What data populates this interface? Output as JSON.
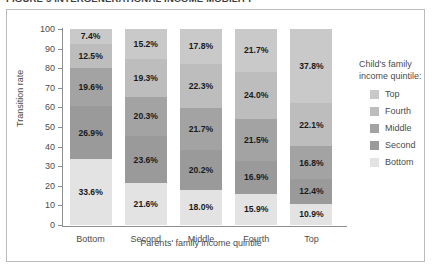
{
  "figure": {
    "title": "FIGURE 5  INTERGENERATIONAL INCOME MOBILITY"
  },
  "chart_data": {
    "type": "bar",
    "stacked": true,
    "title": "",
    "xlabel": "Parents' family income quintile",
    "ylabel": "Transition rate",
    "ylim": [
      0,
      100
    ],
    "yticks": [
      0,
      10,
      20,
      30,
      40,
      50,
      60,
      70,
      80,
      90,
      100
    ],
    "grid": false,
    "legend_position": "right",
    "legend_title": "Child's family income quintile:",
    "categories": [
      "Bottom",
      "Second",
      "Middle",
      "Fourth",
      "Top"
    ],
    "series": [
      {
        "name": "Top",
        "color": "#c9c9c9",
        "values": [
          7.4,
          15.2,
          17.8,
          21.7,
          37.8
        ],
        "labels": [
          "7.4%",
          "15.2%",
          "17.8%",
          "21.7%",
          "37.8%"
        ]
      },
      {
        "name": "Fourth",
        "color": "#bdbdbd",
        "values": [
          12.5,
          19.3,
          22.3,
          24.0,
          22.1
        ],
        "labels": [
          "12.5%",
          "19.3%",
          "22.3%",
          "24.0%",
          "22.1%"
        ]
      },
      {
        "name": "Middle",
        "color": "#a3a3a3",
        "values": [
          19.6,
          20.3,
          21.7,
          21.5,
          16.8
        ],
        "labels": [
          "19.6%",
          "20.3%",
          "21.7%",
          "21.5%",
          "16.8%"
        ]
      },
      {
        "name": "Second",
        "color": "#9a9a9a",
        "values": [
          26.9,
          23.6,
          20.2,
          16.9,
          12.4
        ],
        "labels": [
          "26.9%",
          "23.6%",
          "20.2%",
          "16.9%",
          "12.4%"
        ]
      },
      {
        "name": "Bottom",
        "color": "#e3e3e3",
        "values": [
          33.6,
          21.6,
          18.0,
          15.9,
          10.9
        ],
        "labels": [
          "33.6%",
          "21.6%",
          "18.0%",
          "15.9%",
          "10.9%"
        ]
      }
    ]
  }
}
